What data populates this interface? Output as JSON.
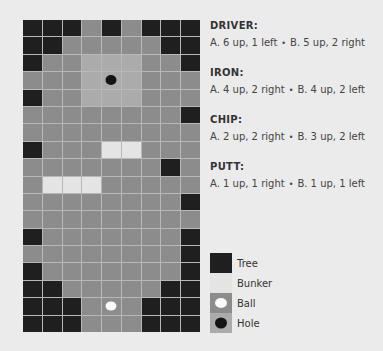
{
  "board": {
    "columns": 9,
    "rows": 18,
    "colors": {
      "tree": "#1f1f1f",
      "fairway": "#8c8c8c",
      "green": "#ababab",
      "bunker": "#e4e4e4",
      "ball": "#fafafa",
      "hole": "#141414"
    },
    "layout": [
      "TTTGTGTTT",
      "TTGGGGGTT",
      "TGGLLLGGT",
      "GGGLLLGGG",
      "TGGLLLGGG",
      "GGGGGGGGT",
      "GGGGGGGGG",
      "TGGGBBGGG",
      "GGGGGGGTG",
      "GBBBGGGGG",
      "GGGGGGGGT",
      "GGGGGGGGG",
      "TGGGGGGGT",
      "GGGGGGGGT",
      "TGGGGGGGT",
      "TTGGGGGTT",
      "TTTGGGTTT",
      "TTTGGGTTT"
    ],
    "hole_position": {
      "row": 3,
      "col": 4
    },
    "ball_position": {
      "row": 16,
      "col": 4
    }
  },
  "clubs": [
    {
      "name": "DRIVER:",
      "option_a": "A. 6 up, 1 left",
      "option_b": "B. 5 up, 2 right"
    },
    {
      "name": "IRON:",
      "option_a": "A. 4 up, 2 right",
      "option_b": "B. 4 up, 2 left"
    },
    {
      "name": "CHIP:",
      "option_a": "A. 2 up, 2 right",
      "option_b": "B. 3 up, 2 left"
    },
    {
      "name": "PUTT:",
      "option_a": "A. 1 up, 1 right",
      "option_b": "B. 1 up, 1 left"
    }
  ],
  "separator": "•",
  "legend": [
    {
      "key": "tree",
      "label": "Tree"
    },
    {
      "key": "bunker",
      "label": "Bunker"
    },
    {
      "key": "ball",
      "label": "Ball"
    },
    {
      "key": "hole",
      "label": "Hole"
    }
  ]
}
